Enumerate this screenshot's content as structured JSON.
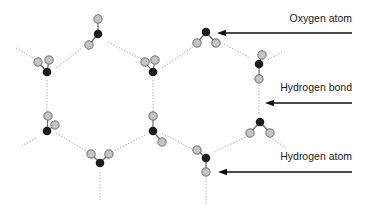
{
  "diagram": {
    "colors": {
      "oxygen": "#1c1c1c",
      "hydrogen": "#c4c4c4",
      "hydrogen_stroke": "#555555",
      "bond": "#6a6a6a",
      "hbond": "#b0b0b0",
      "arrow": "#111111"
    },
    "labels": [
      {
        "id": "oxygen",
        "text": "Oxygen atom",
        "x": 352,
        "y": 19
      },
      {
        "id": "hbond",
        "text": "Hydrogen bond",
        "x": 352,
        "y": 88
      },
      {
        "id": "hydrogen",
        "text": "Hydrogen atom",
        "x": 352,
        "y": 152
      }
    ],
    "arrows": [
      {
        "id": "oxygen",
        "x1": 352,
        "y1": 33,
        "x2": 217,
        "y2": 33
      },
      {
        "id": "hbond",
        "x1": 352,
        "y1": 103,
        "x2": 265,
        "y2": 103
      },
      {
        "id": "hydrogen",
        "x1": 352,
        "y1": 172,
        "x2": 218,
        "y2": 172
      }
    ],
    "molecules": [
      {
        "o": [
          98,
          34
        ],
        "h": [
          [
            98,
            19
          ],
          [
            89,
            45
          ]
        ]
      },
      {
        "o": [
          47,
          72
        ],
        "h": [
          [
            38,
            62
          ],
          [
            49,
            60
          ]
        ]
      },
      {
        "o": [
          153,
          72
        ],
        "h": [
          [
            145,
            62
          ],
          [
            155,
            60
          ]
        ]
      },
      {
        "o": [
          206,
          32
        ],
        "h": [
          [
            197,
            43
          ],
          [
            216,
            43
          ]
        ]
      },
      {
        "o": [
          259,
          64
        ],
        "h": [
          [
            262,
            55
          ],
          [
            259,
            79
          ]
        ]
      },
      {
        "o": [
          47,
          131
        ],
        "h": [
          [
            48,
            116
          ],
          [
            55,
            125
          ]
        ]
      },
      {
        "o": [
          100,
          163
        ],
        "h": [
          [
            91,
            154
          ],
          [
            109,
            154
          ]
        ]
      },
      {
        "o": [
          153,
          131
        ],
        "h": [
          [
            153,
            116
          ],
          [
            162,
            142
          ]
        ]
      },
      {
        "o": [
          260,
          122
        ],
        "h": [
          [
            250,
            133
          ],
          [
            270,
            133
          ]
        ]
      },
      {
        "o": [
          206,
          158
        ],
        "h": [
          [
            197,
            150
          ],
          [
            206,
            172
          ]
        ]
      }
    ],
    "hydrogen_bonds": [
      [
        16,
        48,
        36,
        60
      ],
      [
        56,
        68,
        82,
        48
      ],
      [
        108,
        42,
        143,
        60
      ],
      [
        162,
        68,
        194,
        46
      ],
      [
        47,
        80,
        47,
        113
      ],
      [
        153,
        80,
        153,
        113
      ],
      [
        206,
        0,
        206,
        0
      ],
      [
        224,
        44,
        250,
        58
      ],
      [
        268,
        60,
        282,
        52
      ],
      [
        259,
        85,
        259,
        115
      ],
      [
        36,
        138,
        22,
        146
      ],
      [
        56,
        133,
        88,
        152
      ],
      [
        112,
        152,
        145,
        135
      ],
      [
        162,
        133,
        194,
        150
      ],
      [
        214,
        152,
        248,
        136
      ],
      [
        270,
        137,
        286,
        148
      ],
      [
        100,
        172,
        100,
        200
      ],
      [
        206,
        178,
        206,
        204
      ],
      [
        47,
        32,
        47,
        32
      ]
    ]
  }
}
